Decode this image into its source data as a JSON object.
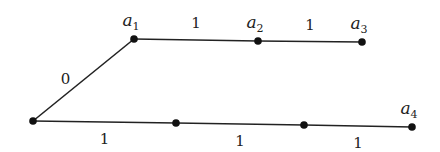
{
  "diagram": {
    "type": "weighted-tree",
    "nodes": [
      {
        "id": "root",
        "label": "",
        "x": 33,
        "y": 121
      },
      {
        "id": "a1",
        "label": "a",
        "sub": "1",
        "x": 134,
        "y": 39
      },
      {
        "id": "a2",
        "label": "a",
        "sub": "2",
        "x": 258,
        "y": 41
      },
      {
        "id": "a3",
        "label": "a",
        "sub": "3",
        "x": 362,
        "y": 42
      },
      {
        "id": "b1",
        "label": "",
        "x": 176,
        "y": 123
      },
      {
        "id": "b2",
        "label": "",
        "x": 304,
        "y": 125
      },
      {
        "id": "a4",
        "label": "a",
        "sub": "4",
        "x": 412,
        "y": 127
      }
    ],
    "edges": [
      {
        "from": "root",
        "to": "a1",
        "weight": "0"
      },
      {
        "from": "a1",
        "to": "a2",
        "weight": "1"
      },
      {
        "from": "a2",
        "to": "a3",
        "weight": "1"
      },
      {
        "from": "root",
        "to": "b1",
        "weight": "1"
      },
      {
        "from": "b1",
        "to": "b2",
        "weight": "1"
      },
      {
        "from": "b2",
        "to": "a4",
        "weight": "1"
      }
    ]
  }
}
